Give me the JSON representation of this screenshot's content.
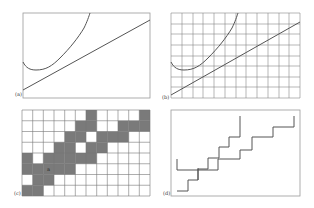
{
  "figure": {
    "panels": [
      {
        "id": "a",
        "label": "(a)",
        "description": "Continuous line and curve, no grid"
      },
      {
        "id": "b",
        "label": "(b)",
        "description": "Continuous line and curve over grid"
      },
      {
        "id": "c",
        "label": "(c)",
        "description": "Rasterized line and curve as shaded grid cells",
        "grid": {
          "cols": 12,
          "rows": 8
        },
        "shaded_cells": [
          [
            0,
            6
          ],
          [
            0,
            11
          ],
          [
            1,
            5
          ],
          [
            1,
            6
          ],
          [
            1,
            9
          ],
          [
            1,
            10
          ],
          [
            1,
            11
          ],
          [
            2,
            4
          ],
          [
            2,
            5
          ],
          [
            2,
            7
          ],
          [
            2,
            8
          ],
          [
            2,
            9
          ],
          [
            3,
            3
          ],
          [
            3,
            4
          ],
          [
            3,
            6
          ],
          [
            3,
            7
          ],
          [
            4,
            0
          ],
          [
            4,
            2
          ],
          [
            4,
            3
          ],
          [
            4,
            4
          ],
          [
            4,
            5
          ],
          [
            4,
            6
          ],
          [
            5,
            0
          ],
          [
            5,
            1
          ],
          [
            5,
            2
          ],
          [
            5,
            3
          ],
          [
            5,
            4
          ],
          [
            6,
            1
          ],
          [
            6,
            2
          ],
          [
            7,
            0
          ],
          [
            7,
            1
          ]
        ],
        "marker": "a"
      },
      {
        "id": "d",
        "label": "(d)",
        "description": "Staircase approximations of line and curve"
      }
    ],
    "colors": {
      "stroke": "#555555",
      "grid": "#888888",
      "shade": "#7a7a7a",
      "frame": "#999999"
    }
  }
}
